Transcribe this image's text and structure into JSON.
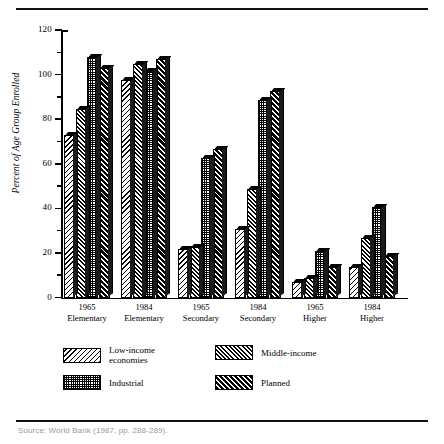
{
  "figure": {
    "caption": "Source: World Bank (1987, pp. 288-289)."
  },
  "chart_data": {
    "type": "bar",
    "title": "",
    "xlabel": "",
    "ylabel": "Percent of Age Group Enrolled",
    "ylim": [
      0,
      120
    ],
    "yticks": [
      0,
      20,
      40,
      60,
      80,
      100,
      120
    ],
    "ytick_labels": [
      "0",
      "20",
      "40",
      "60",
      "80",
      "100",
      "120"
    ],
    "grid": false,
    "legend_position": "below-axes",
    "categories": [
      {
        "year": "1965",
        "level": "Elementary"
      },
      {
        "year": "1984",
        "level": "Elementary"
      },
      {
        "year": "1965",
        "level": "Secondary"
      },
      {
        "year": "1984",
        "level": "Secondary"
      },
      {
        "year": "1965",
        "level": "Higher"
      },
      {
        "year": "1984",
        "level": "Higher"
      }
    ],
    "series": [
      {
        "name": "Low-income economies",
        "legend_line1": "Low-income",
        "legend_line2": "economies",
        "pattern": "diagonal-hatch-backslash",
        "values": [
          73,
          98,
          22,
          31,
          7,
          14
        ]
      },
      {
        "name": "Middle-income",
        "legend_line1": "Middle-income",
        "legend_line2": "",
        "pattern": "diagonal-hatch-slash-dense",
        "values": [
          85,
          105,
          23,
          49,
          9,
          27
        ]
      },
      {
        "name": "Industrial",
        "legend_line1": "Industrial",
        "legend_line2": "",
        "pattern": "crosshatch-grid",
        "values": [
          108,
          102,
          63,
          89,
          21,
          41
        ]
      },
      {
        "name": "Planned",
        "legend_line1": "Planned",
        "legend_line2": "",
        "pattern": "diagonal-hatch-slash-wide",
        "values": [
          103,
          107,
          67,
          93,
          14,
          19
        ]
      }
    ]
  }
}
